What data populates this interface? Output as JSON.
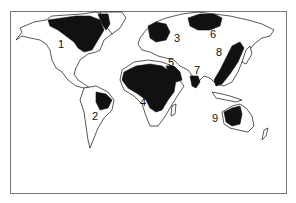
{
  "map": {
    "type": "world-outline-map",
    "shading_color": "#111111",
    "outline_color": "#111111",
    "background": "#ffffff",
    "frame_color": "#777777",
    "regions": [
      {
        "id": 1,
        "label": "1",
        "area": "Northern North America (Canada / Hudson Bay / Greenland coast)"
      },
      {
        "id": 2,
        "label": "2",
        "area": "Eastern South America (Brazil)"
      },
      {
        "id": 3,
        "label": "3",
        "area": "Scandinavia / Northern Europe"
      },
      {
        "id": 4,
        "label": "4",
        "area": "Africa (Sahara to central/southern Africa)"
      },
      {
        "id": 5,
        "label": "5",
        "area": "Arabian Peninsula / Middle East"
      },
      {
        "id": 6,
        "label": "6",
        "area": "Northern Siberia"
      },
      {
        "id": 7,
        "label": "7",
        "area": "India / South Asia"
      },
      {
        "id": 8,
        "label": "8",
        "area": "East Asia (China coast / Korea)"
      },
      {
        "id": 9,
        "label": "9",
        "area": "Western Australia"
      }
    ]
  }
}
